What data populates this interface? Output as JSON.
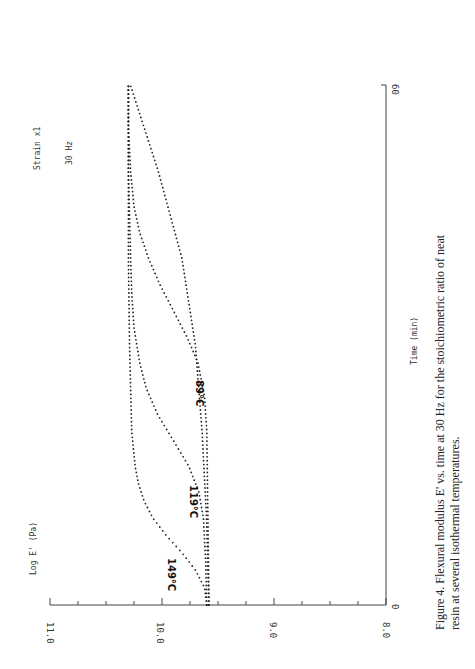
{
  "chart_data": {
    "type": "line",
    "orientation": "rotated-90-ccw",
    "title": "",
    "caption_line1": "Figure 4. Flexural modulus E' vs. time at 30 Hz for the stoichiometric ratio of neat",
    "caption_line2": "resin at several isothermal temperatures.",
    "xlabel": "Time (min)",
    "ylabel": "Log E' (Pa)",
    "xlim": [
      0,
      60
    ],
    "ylim": [
      8.0,
      11.0
    ],
    "x_ticks": [
      "0",
      "60"
    ],
    "y_ticks": [
      "11.0",
      "10.0",
      "9.0",
      "8.0"
    ],
    "annotations": [
      "Strain x1",
      "30 Hz"
    ],
    "legend": [],
    "grid": false,
    "series": [
      {
        "name": "149°C",
        "x": [
          0,
          2,
          4,
          6,
          8,
          10,
          12,
          14,
          16,
          20,
          25,
          30,
          40,
          50,
          60
        ],
        "values": [
          9.6,
          9.62,
          9.7,
          9.82,
          9.96,
          10.08,
          10.16,
          10.21,
          10.24,
          10.27,
          10.28,
          10.29,
          10.3,
          10.3,
          10.3
        ]
      },
      {
        "name": "119°C",
        "x": [
          0,
          5,
          10,
          13,
          16,
          19,
          22,
          25,
          28,
          32,
          36,
          40,
          50,
          60
        ],
        "values": [
          9.6,
          9.61,
          9.63,
          9.67,
          9.76,
          9.9,
          10.04,
          10.14,
          10.2,
          10.25,
          10.27,
          10.28,
          10.3,
          10.3
        ]
      },
      {
        "name": "89°C",
        "x": [
          0,
          10,
          20,
          24,
          28,
          31,
          34,
          37,
          40,
          43,
          46,
          50,
          55,
          60
        ],
        "values": [
          9.58,
          9.59,
          9.6,
          9.62,
          9.68,
          9.78,
          9.9,
          10.02,
          10.12,
          10.2,
          10.25,
          10.28,
          10.3,
          10.3
        ]
      },
      {
        "name": "baseline",
        "x": [
          0,
          10,
          20,
          30,
          40,
          50,
          60
        ],
        "values": [
          9.6,
          9.62,
          9.66,
          9.72,
          9.84,
          10.05,
          10.3
        ]
      }
    ]
  },
  "labels": {
    "strain": "Strain x1",
    "freq": "30 Hz",
    "ylabel": "Log E' (Pa)",
    "xlabel": "Time (min)",
    "t149": "149°C",
    "t119": "119°C",
    "t89": "89°C",
    "y11": "11.0",
    "y10": "10.0",
    "y9": "9.0",
    "y8": "8.0",
    "x0": "0",
    "x60": "60",
    "caption1": "Figure 4. Flexural modulus E' vs. time at 30 Hz for the stoichiometric ratio of neat",
    "caption2": "resin at several isothermal temperatures."
  }
}
